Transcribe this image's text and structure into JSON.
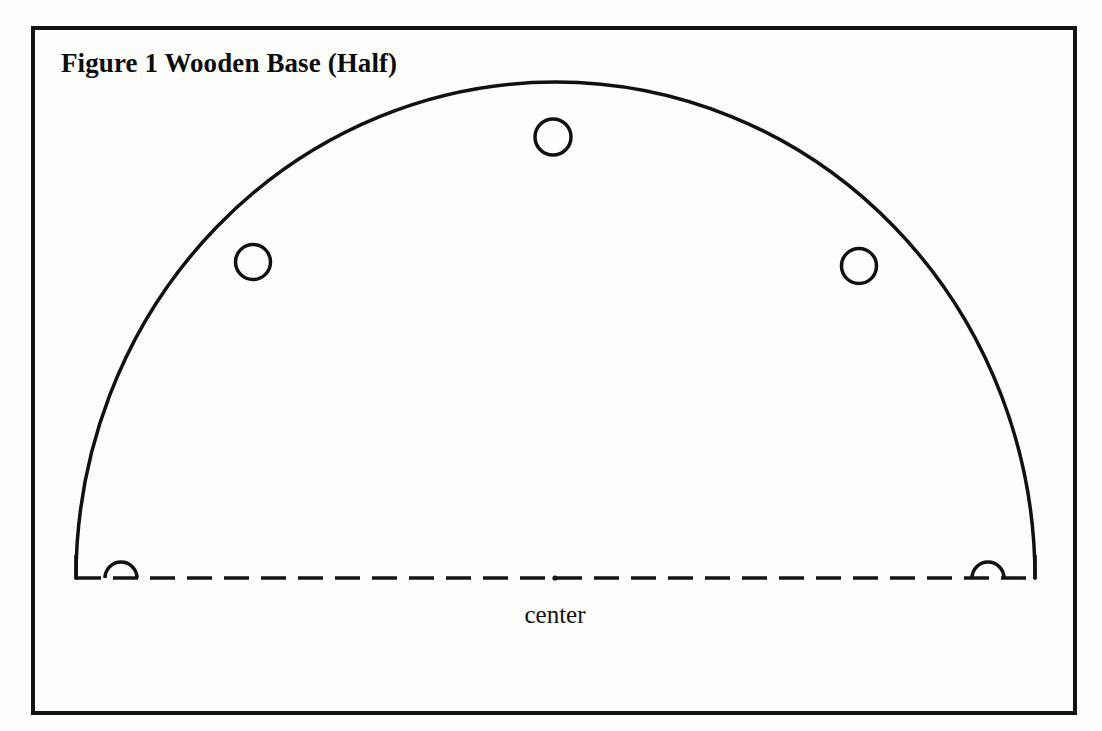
{
  "document": {
    "kind": "woodworking-plan-figure",
    "background_color": "#fdfdfc",
    "ink_color": "#111111"
  },
  "frame": {
    "name": "figure-border",
    "x": 33,
    "y": 28,
    "width": 1042,
    "height": 685,
    "stroke_width": 4,
    "color": "#131313"
  },
  "title": {
    "text": "Figure 1 Wooden Base (Half)",
    "x": 61,
    "y": 47,
    "font_size": 27,
    "bold": true
  },
  "center_label": {
    "text": "center",
    "x": 559,
    "y": 600,
    "font_size": 25,
    "bold": false
  },
  "drawing": {
    "name": "semicircular-wooden-base-half",
    "arc": {
      "description": "semi-elliptical outer profile of the wooden base",
      "left_x": 76,
      "right_x": 1035,
      "baseline_y": 578,
      "apex_y": 82,
      "radius_x": 479.5,
      "radius_y": 496,
      "stroke_width": 3.5,
      "color": "#111111"
    },
    "end_stubs": [
      {
        "name": "left-end-stub",
        "x": 76,
        "y_top": 556,
        "y_bottom": 578
      },
      {
        "name": "right-end-stub",
        "x": 1035,
        "y_top": 556,
        "y_bottom": 578
      }
    ],
    "center_line": {
      "description": "dash-dot center line along the flat edge",
      "x_start": 76,
      "x_end": 1035,
      "y": 578,
      "dash": 25,
      "gap": 12,
      "stroke_width": 3.5,
      "color": "#141414",
      "center_dot_x": 555
    },
    "holes": [
      {
        "name": "hole-left",
        "cx": 253,
        "cy": 262,
        "r": 17.5,
        "stroke_width": 3.5
      },
      {
        "name": "hole-top",
        "cx": 553,
        "cy": 137,
        "r": 18,
        "stroke_width": 3.5
      },
      {
        "name": "hole-right",
        "cx": 859,
        "cy": 266,
        "r": 17.5,
        "stroke_width": 3.5
      }
    ],
    "half_holes": [
      {
        "name": "half-hole-left",
        "cx": 121,
        "cy": 578,
        "r": 16,
        "stroke_width": 3.5
      },
      {
        "name": "half-hole-right",
        "cx": 988,
        "cy": 578,
        "r": 16,
        "stroke_width": 3.5
      }
    ]
  }
}
